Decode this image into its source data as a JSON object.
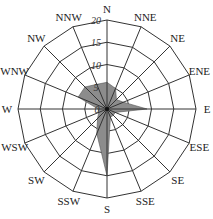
{
  "chart_data": {
    "type": "radar",
    "title": "",
    "directions": [
      "N",
      "NNE",
      "NE",
      "ENE",
      "E",
      "ESE",
      "SE",
      "SSE",
      "S",
      "SSW",
      "SW",
      "WSW",
      "W",
      "WNW",
      "NW",
      "NNW"
    ],
    "values": [
      6,
      5,
      3,
      4,
      9,
      2,
      2,
      2,
      15,
      6,
      3,
      2,
      2,
      7,
      7,
      6
    ],
    "rlim": [
      0,
      20
    ],
    "rticks": [
      "0",
      "5",
      "10",
      "15",
      "20"
    ],
    "grid": true,
    "fill_color": "#8c8c8c"
  }
}
